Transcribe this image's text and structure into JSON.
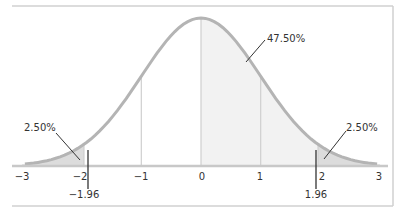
{
  "chart_data": {
    "type": "area",
    "title": "",
    "xlabel": "",
    "ylabel": "",
    "distribution": "standard normal",
    "xlim": [
      -3,
      3
    ],
    "x_ticks": [
      -3,
      -2,
      -1,
      0,
      1,
      2,
      3
    ],
    "x_tick_labels": [
      "−3",
      "−2",
      "−1",
      "0",
      "1",
      "2",
      "3"
    ],
    "critical_values": [
      -1.96,
      1.96
    ],
    "critical_labels": [
      "−1.96",
      "1.96"
    ],
    "reference_lines": [
      -1,
      0,
      1
    ],
    "shaded_regions": [
      {
        "from": -3,
        "to": -1.96,
        "area_label": "2.50%",
        "area": 2.5
      },
      {
        "from": 0,
        "to": 1.96,
        "area_label": "47.50%",
        "area": 47.5
      },
      {
        "from": 1.96,
        "to": 3,
        "area_label": "2.50%",
        "area": 2.5
      }
    ],
    "annotations": [
      "2.50%",
      "47.50%",
      "2.50%"
    ],
    "grid": false,
    "legend": null
  },
  "labels": {
    "left_tail": "2.50%",
    "center": "47.50%",
    "right_tail": "2.50%",
    "crit_left": "−1.96",
    "crit_right": "1.96",
    "ticks": [
      "−3",
      "−2",
      "−1",
      "0",
      "1",
      "2",
      "3"
    ]
  },
  "colors": {
    "curve": "#b4b4b4",
    "fill_light": "#f2f2f2",
    "fill_tail": "#dcdcdc",
    "axis": "#c8c8c8",
    "text": "#333333",
    "frame": "#cfcfcf"
  }
}
